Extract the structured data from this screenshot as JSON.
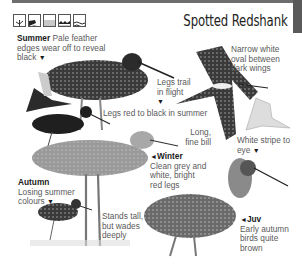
{
  "page": {
    "title": "Spotted Redshank",
    "habitat_icons": [
      "woodland-icon",
      "coast-icon",
      "farmland-icon",
      "marsh-icon",
      "water-icon"
    ]
  },
  "labels": {
    "summer": {
      "heading": "Summer",
      "text": "Pale feather edges wear off to reveal black",
      "marker": "▼"
    },
    "narrow_white": {
      "text": "Narrow white oval between dark wings"
    },
    "legs_trail": {
      "text": "Legs trail in flight",
      "marker": "▼"
    },
    "legs_red": {
      "text": "Legs red to black in summer",
      "marker": "◄"
    },
    "long_bill": {
      "text": "Long, fine bill"
    },
    "white_stripe": {
      "text": "White stripe to eye",
      "marker": "▼"
    },
    "winter": {
      "heading": "Winter",
      "text": "Clean grey and white, bright red legs",
      "marker": "◄"
    },
    "autumn": {
      "heading": "Autumn",
      "text": "Losing summer colours",
      "marker": "▼"
    },
    "stands_tall": {
      "text": "Stands tall, but wades deeply"
    },
    "juv": {
      "heading": "Juv",
      "text": "Early autumn birds quite brown",
      "marker": "◄"
    }
  },
  "colors": {
    "bar": "#6d6d6d",
    "text": "#5a5a5a",
    "heading": "#1a1a1a"
  }
}
